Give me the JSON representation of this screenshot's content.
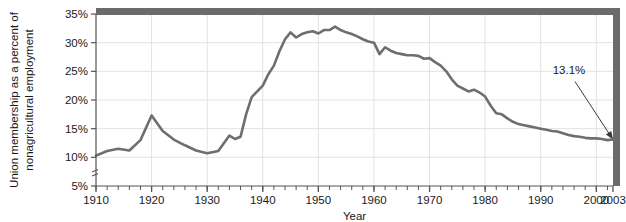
{
  "chart_data": {
    "type": "line",
    "title": "",
    "xlabel": "Year",
    "ylabel": "Union membership as a percent of nonagricultural employment",
    "xlim": [
      1910,
      2003
    ],
    "ylim": [
      5,
      35
    ],
    "ytick_values": [
      5,
      10,
      15,
      20,
      25,
      30,
      35
    ],
    "ytick_labels": [
      "5%",
      "10%",
      "15%",
      "20%",
      "25%",
      "30%",
      "35%"
    ],
    "xtick_values": [
      1910,
      1920,
      1930,
      1940,
      1950,
      1960,
      1970,
      1980,
      1990,
      2000,
      2003
    ],
    "xtick_labels": [
      "1910",
      "1920",
      "1930",
      "1940",
      "1950",
      "1960",
      "1970",
      "1980",
      "1990",
      "2000",
      "2003"
    ],
    "x_minor_tick_interval": 2,
    "grid": true,
    "grid_axis": "both",
    "legend": "none",
    "y_axis_break": true,
    "series": [
      {
        "name": "Union membership as a percent of nonagricultural employment",
        "color": "#6e6e6e",
        "x": [
          1910,
          1912,
          1914,
          1916,
          1918,
          1920,
          1922,
          1924,
          1926,
          1928,
          1930,
          1932,
          1934,
          1935,
          1936,
          1937,
          1938,
          1939,
          1940,
          1941,
          1942,
          1943,
          1944,
          1945,
          1946,
          1947,
          1948,
          1949,
          1950,
          1951,
          1952,
          1953,
          1954,
          1955,
          1956,
          1957,
          1958,
          1959,
          1960,
          1961,
          1962,
          1963,
          1964,
          1965,
          1966,
          1967,
          1968,
          1969,
          1970,
          1971,
          1972,
          1973,
          1974,
          1975,
          1976,
          1977,
          1978,
          1979,
          1980,
          1981,
          1982,
          1983,
          1984,
          1985,
          1986,
          1987,
          1988,
          1989,
          1990,
          1991,
          1992,
          1993,
          1994,
          1995,
          1996,
          1997,
          1998,
          1999,
          2000,
          2001,
          2002,
          2003
        ],
        "y": [
          10.3,
          11.1,
          11.5,
          11.2,
          13.0,
          17.3,
          14.6,
          13.1,
          12.1,
          11.2,
          10.7,
          11.1,
          13.8,
          13.2,
          13.6,
          17.5,
          20.5,
          21.5,
          22.5,
          24.5,
          26.0,
          28.5,
          30.6,
          31.8,
          30.9,
          31.5,
          31.8,
          32.0,
          31.6,
          32.2,
          32.2,
          32.8,
          32.2,
          31.8,
          31.5,
          31.1,
          30.6,
          30.2,
          30.0,
          28.0,
          29.2,
          28.6,
          28.2,
          28.0,
          27.8,
          27.8,
          27.7,
          27.2,
          27.3,
          26.6,
          26.0,
          25.0,
          23.6,
          22.5,
          22.0,
          21.5,
          21.8,
          21.3,
          20.6,
          19.0,
          17.7,
          17.5,
          16.8,
          16.2,
          15.8,
          15.6,
          15.4,
          15.2,
          15.0,
          14.8,
          14.6,
          14.5,
          14.2,
          13.9,
          13.7,
          13.6,
          13.4,
          13.3,
          13.3,
          13.2,
          13.0,
          13.1
        ]
      }
    ],
    "annotations": [
      {
        "label": "13.1%",
        "x": 2003,
        "y": 13.1,
        "type": "arrow-callout"
      }
    ]
  },
  "style": {
    "line_color": "#6e6e6e",
    "frame_color": "#6b6b6b",
    "grid_color": "#e2e2e2",
    "axis_color": "#555555",
    "text_color": "#1a1a1a",
    "background": "#ffffff"
  },
  "icons": {
    "axis_break": "axis-break-icon",
    "callout_arrow": "arrow-icon"
  }
}
